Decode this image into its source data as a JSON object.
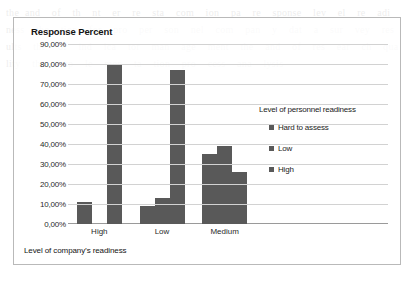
{
  "chart_data": {
    "type": "bar",
    "title": "Response Percent",
    "xlabel": "Level of company’s readiness",
    "ylabel": "",
    "categories": [
      "High",
      "Low",
      "Medium"
    ],
    "series": [
      {
        "name": "Hard to assess",
        "values": [
          11.0,
          9.0,
          35.0
        ],
        "color": "#595959"
      },
      {
        "name": "Low",
        "values": [
          0.0,
          13.0,
          39.0
        ],
        "color": "#595959"
      },
      {
        "name": "High",
        "values": [
          80.0,
          77.0,
          26.0
        ],
        "color": "#595959"
      }
    ],
    "legend_title": "Level of personnel readiness",
    "legend_position": "right",
    "ylim": [
      0,
      90
    ],
    "yticks": [
      "0,00%",
      "10,00%",
      "20,00%",
      "30,00%",
      "40,00%",
      "50,00%",
      "60,00%",
      "70,00%",
      "80,00%",
      "90,00%"
    ],
    "ytick_values": [
      0,
      10,
      20,
      30,
      40,
      50,
      60,
      70,
      80,
      90
    ],
    "grid": true
  },
  "background_text": "the and  of  th  nt  er  re  sta  com  ion  pa  re  sponse  lev  el  re  adi  ness  the  tion  for  pro  per  son  nel  com  pan  y  dat  a  sur  vey  res  ults  the  of  ind  ica  tor  man  age  ment  the  and  of  res  ear  ch  qua  lity  the  imp  le  men  ta  tion  pro  cess  ana  lysis"
}
